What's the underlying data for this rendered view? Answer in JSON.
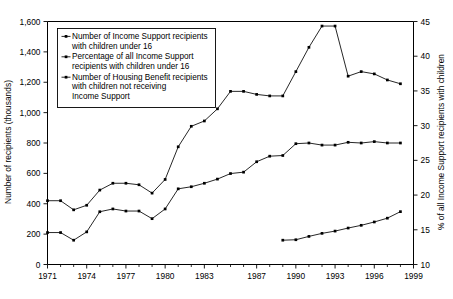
{
  "chart_data": {
    "type": "line",
    "title": "",
    "xlabel": "",
    "ylabel": "Number of recipients (thousands)",
    "y2label": "% of all Income Support recipients with children",
    "xlim": [
      1971,
      1999
    ],
    "ylim": [
      0,
      1600
    ],
    "y2lim": [
      10,
      45
    ],
    "grid": false,
    "legend_position": "top-left",
    "x_tick_labels": [
      "1971",
      "1974",
      "1977",
      "1980",
      "1983",
      "1987",
      "1990",
      "1993",
      "1996",
      "1999"
    ],
    "x_tick_values": [
      1971,
      1974,
      1977,
      1980,
      1983,
      1987,
      1990,
      1993,
      1996,
      1999
    ],
    "x_minor_ticks": [
      1971,
      1972,
      1973,
      1974,
      1975,
      1976,
      1977,
      1978,
      1979,
      1980,
      1981,
      1982,
      1983,
      1984,
      1985,
      1986,
      1987,
      1988,
      1989,
      1990,
      1991,
      1992,
      1993,
      1994,
      1995,
      1996,
      1997,
      1998,
      1999
    ],
    "y_tick_labels": [
      "0",
      "200",
      "400",
      "600",
      "800",
      "1,000",
      "1,200",
      "1,400",
      "1,600"
    ],
    "y_tick_values": [
      0,
      200,
      400,
      600,
      800,
      1000,
      1200,
      1400,
      1600
    ],
    "y2_tick_labels": [
      "10",
      "15",
      "20",
      "25",
      "30",
      "35",
      "40",
      "45"
    ],
    "y2_tick_values": [
      10,
      15,
      20,
      25,
      30,
      35,
      40,
      45
    ],
    "series": [
      {
        "name": "Number of Income Support recipients with children under 16",
        "axis": "left",
        "legend_lines": [
          "Number of Income Support recipients",
          "with children under 16"
        ],
        "x": [
          1971,
          1972,
          1973,
          1974,
          1975,
          1976,
          1977,
          1978,
          1979,
          1980,
          1981,
          1982,
          1983,
          1984,
          1985,
          1986,
          1987,
          1988,
          1989,
          1990,
          1991,
          1992,
          1993,
          1994,
          1995,
          1996,
          1997,
          1998
        ],
        "values": [
          420,
          420,
          360,
          390,
          490,
          535,
          535,
          525,
          470,
          560,
          775,
          910,
          945,
          1025,
          1140,
          1140,
          1120,
          1110,
          1110,
          1270,
          1430,
          1570,
          1570,
          1240,
          1270,
          1255,
          1215,
          1190
        ]
      },
      {
        "name": "Percentage of all Income Support recipients with children under 16",
        "axis": "right",
        "legend_lines": [
          "Percentage of all Income Support",
          "recipients with children under 16"
        ],
        "x": [
          1971,
          1972,
          1973,
          1974,
          1975,
          1976,
          1977,
          1978,
          1979,
          1980,
          1981,
          1982,
          1983,
          1984,
          1985,
          1986,
          1987,
          1988,
          1989,
          1990,
          1991,
          1992,
          1993,
          1994,
          1995,
          1996,
          1997,
          1998
        ],
        "values": [
          14.6,
          14.6,
          13.5,
          14.7,
          17.6,
          18.0,
          17.7,
          17.7,
          16.6,
          18.0,
          20.9,
          21.2,
          21.7,
          22.3,
          23.1,
          23.3,
          24.8,
          25.6,
          25.7,
          27.4,
          27.5,
          27.2,
          27.2,
          27.6,
          27.5,
          27.7,
          27.5,
          27.5
        ]
      },
      {
        "name": "Number of Housing Benefit recipients with children not receiving Income Support",
        "axis": "left",
        "legend_lines": [
          "Number of Housing Benefit recipients",
          "with children not receiving",
          "Income Support"
        ],
        "x": [
          1989,
          1990,
          1991,
          1992,
          1993,
          1994,
          1995,
          1996,
          1997,
          1998
        ],
        "values": [
          160,
          163,
          185,
          205,
          220,
          240,
          258,
          280,
          305,
          348
        ]
      }
    ]
  },
  "colors": {
    "line": "#000000",
    "background": "#ffffff",
    "frame": "#000000"
  }
}
